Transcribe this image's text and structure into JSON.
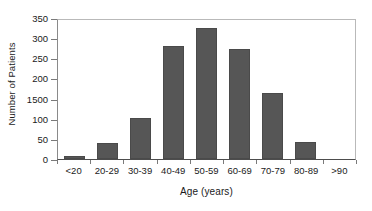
{
  "chart_data": {
    "type": "bar",
    "title": "",
    "subtitle": "",
    "xlabel": "Age (years)",
    "ylabel": "Number of Patients",
    "categories": [
      "<20",
      "20-29",
      "30-39",
      "40-49",
      "50-59",
      "60-69",
      "70-79",
      "80-89",
      ">90"
    ],
    "values": [
      8,
      40,
      102,
      280,
      325,
      272,
      164,
      42,
      0
    ],
    "series": [
      {
        "name": "Number of Patients",
        "values": [
          8,
          40,
          102,
          280,
          325,
          272,
          164,
          42,
          0
        ]
      }
    ],
    "ylim": [
      0,
      350
    ],
    "ytick_values": [
      0,
      50,
      100,
      150,
      200,
      250,
      300,
      350
    ],
    "ytick_labels": [
      "0",
      "50",
      "100",
      "1500",
      "200",
      "250",
      "300",
      "350"
    ],
    "grid": false,
    "legend": false,
    "legend_position": "none",
    "bar_color": "#565656",
    "background_color": "#ffffff",
    "axis_color": "#4d4d4d",
    "annotations": []
  }
}
